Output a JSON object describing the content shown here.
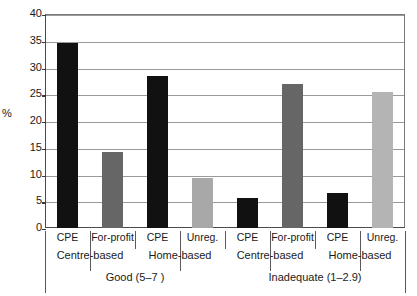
{
  "chart_data": {
    "type": "bar",
    "title": "",
    "xlabel": "",
    "ylabel": "%",
    "ylim": [
      0,
      40
    ],
    "yticks": [
      0,
      5,
      10,
      15,
      20,
      25,
      30,
      35,
      40
    ],
    "ytick_labels": [
      "0",
      "5",
      "10",
      "15",
      "20",
      "25",
      "30",
      "35",
      "40"
    ],
    "grid": "horizontal",
    "legend": "none",
    "categories": [
      "CPE",
      "For-profit",
      "CPE",
      "Unreg.",
      "CPE",
      "For-profit",
      "CPE",
      "Unreg."
    ],
    "values": [
      34.6,
      14.2,
      28.4,
      9.4,
      5.7,
      27.0,
      6.6,
      25.5
    ],
    "bar_colors": [
      "#111111",
      "#666666",
      "#111111",
      "#a8a8a8",
      "#111111",
      "#666666",
      "#111111",
      "#b4b4b4"
    ],
    "group_tier2": [
      "Centre-based",
      "Home-based",
      "Centre-based",
      "Home-based"
    ],
    "group_tier3": [
      "Good (5–7 )",
      "Inadequate (1–2.9)"
    ]
  },
  "axis": {
    "y_title": "%",
    "y_ticks": [
      {
        "label": "40",
        "value": 40
      },
      {
        "label": "35",
        "value": 35
      },
      {
        "label": "30",
        "value": 30
      },
      {
        "label": "25",
        "value": 25
      },
      {
        "label": "20",
        "value": 20
      },
      {
        "label": "15",
        "value": 15
      },
      {
        "label": "10",
        "value": 10
      },
      {
        "label": "5",
        "value": 5
      },
      {
        "label": "0",
        "value": 0
      }
    ]
  },
  "bars": [
    {
      "label": "CPE",
      "value": 34.6,
      "color": "#111111"
    },
    {
      "label": "For-profit",
      "value": 14.2,
      "color": "#666666"
    },
    {
      "label": "CPE",
      "value": 28.4,
      "color": "#111111"
    },
    {
      "label": "Unreg.",
      "value": 9.4,
      "color": "#a8a8a8"
    },
    {
      "label": "CPE",
      "value": 5.7,
      "color": "#111111"
    },
    {
      "label": "For-profit",
      "value": 27.0,
      "color": "#666666"
    },
    {
      "label": "CPE",
      "value": 6.6,
      "color": "#111111"
    },
    {
      "label": "Unreg.",
      "value": 25.5,
      "color": "#b4b4b4"
    }
  ],
  "tier2_labels": [
    "Centre-based",
    "Home-based",
    "Centre-based",
    "Home-based"
  ],
  "tier3_labels": [
    "Good (5–7 )",
    "Inadequate (1–2.9)"
  ]
}
